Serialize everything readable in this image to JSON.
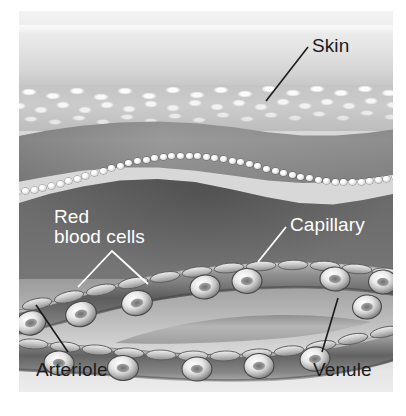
{
  "figure": {
    "style": "grayscale medical illustration",
    "background_color": "#ffffff",
    "illustration_background": "#d8d8d8"
  },
  "labels": {
    "skin": {
      "text": "Skin",
      "color": "#1b1b1b",
      "leader": "line"
    },
    "red_blood_cells": {
      "text": "Red\nblood cells",
      "color": "#ffffff",
      "leader": "forked-v"
    },
    "capillary": {
      "text": "Capillary",
      "color": "#ffffff",
      "leader": "line"
    },
    "arteriole": {
      "text": "Arteriole",
      "color": "#1b1b1b",
      "leader": "line"
    },
    "venule": {
      "text": "Venule",
      "color": "#1b1b1b",
      "leader": "line"
    }
  },
  "anatomy": {
    "layers": [
      {
        "name": "epidermis-surface",
        "tone": "#e6e6e6"
      },
      {
        "name": "epidermis-texture",
        "tone": "#c4c4c4"
      },
      {
        "name": "dermis-band",
        "tone": "#949494"
      },
      {
        "name": "basal-cell-row",
        "tone": "#ededed"
      },
      {
        "name": "hypodermis",
        "tone": "#6a6a6a"
      },
      {
        "name": "lower-field",
        "tone": "#cfcfcf"
      }
    ],
    "vessels": [
      {
        "name": "arteriole",
        "tone": "#6f6f6f"
      },
      {
        "name": "capillary",
        "tone": "#7a7a7a"
      },
      {
        "name": "venule",
        "tone": "#6b6b6b"
      }
    ],
    "red_blood_cell_shape": "biconcave disc"
  }
}
